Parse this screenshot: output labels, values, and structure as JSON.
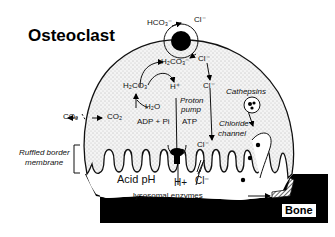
{
  "diagram": {
    "title": "Osteoclast",
    "labels": {
      "hco3_out": "HCO₃⁻",
      "cl_out": "Cl⁻",
      "h2co3_top": "H₂CO₃⁻",
      "cl_in_top": "Cl⁻",
      "h2co3": "H₂CO₃",
      "h_plus": "H⁺",
      "cl_mid": "Cl⁻",
      "cathepsins": "Cathepsins",
      "co2_out": "CO₂",
      "co2_in": "CO₂",
      "h2o": "H₂O",
      "proton_pump_1": "Proton",
      "proton_pump_2": "pump",
      "adp_pi": "ADP + Pi",
      "atp": "ATP",
      "chloride_channel_1": "Chloride",
      "chloride_channel_2": "channel",
      "cl_low": "Cl⁻",
      "ruffled_1": "Ruffled border",
      "ruffled_2": "membrane",
      "acid_ph": "Acid pH",
      "h_plus_bottom": "H+",
      "cl_bottom": "Cl⁻",
      "lysosomal": "lysosomal enzymes",
      "bone": "Bone"
    },
    "colors": {
      "cell_fill": "#e6e6e6",
      "outline": "#111111",
      "bone": "#000000",
      "lacuna": "#ffffff"
    }
  }
}
